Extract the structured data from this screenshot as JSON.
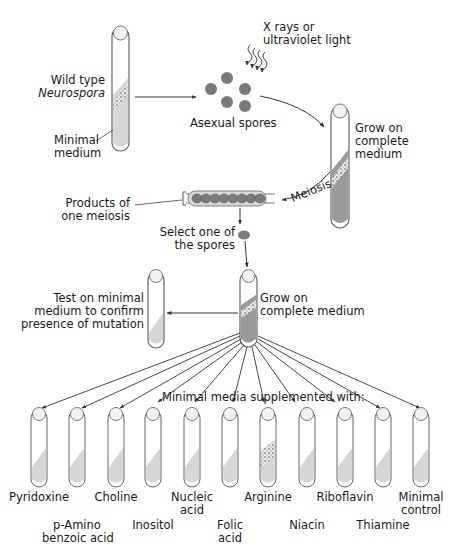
{
  "diagram": {
    "type": "flow-diagram",
    "labels": {
      "wild_type_line1": "Wild type",
      "wild_type_line2": "Neurospora",
      "minimal_medium_line1": "Minimal",
      "minimal_medium_line2": "medium",
      "radiation_line1": "X rays or",
      "radiation_line2": "ultraviolet light",
      "asexual_spores": "Asexual spores",
      "grow_complete_line1": "Grow on",
      "grow_complete_line2": "complete",
      "grow_complete_line3": "medium",
      "meiosis": "Meiosis",
      "products_line1": "Products of",
      "products_line2": "one meiosis",
      "select_line1": "Select one of",
      "select_line2": "the spores",
      "test_line1": "Test on minimal",
      "test_line2": "medium to confirm",
      "test_line3": "presence of mutation",
      "grow2_line1": "Grow on",
      "grow2_line2": "complete medium",
      "supplemented": "Minimal media supplemented with:"
    },
    "supplement_tubes": [
      {
        "line1": "Pyridoxine",
        "line2": "",
        "growth": false
      },
      {
        "line1": "p-Amino",
        "line2": "benzoic acid",
        "growth": false
      },
      {
        "line1": "Choline",
        "line2": "",
        "growth": false
      },
      {
        "line1": "Inositol",
        "line2": "",
        "growth": false
      },
      {
        "line1": "Nucleic",
        "line2": "acid",
        "growth": false
      },
      {
        "line1": "Folic",
        "line2": "acid",
        "growth": false
      },
      {
        "line1": "Arginine",
        "line2": "",
        "growth": true
      },
      {
        "line1": "Niacin",
        "line2": "",
        "growth": false
      },
      {
        "line1": "Riboflavin",
        "line2": "",
        "growth": false
      },
      {
        "line1": "Thiamine",
        "line2": "",
        "growth": false
      },
      {
        "line1": "Minimal",
        "line2": "control",
        "growth": false
      }
    ],
    "colors": {
      "spore": "#7a7a7a",
      "medium_minimal": "#d6d6d6",
      "medium_complete": "#9a9a9a",
      "outline": "#555555",
      "arrow": "#333333"
    }
  }
}
